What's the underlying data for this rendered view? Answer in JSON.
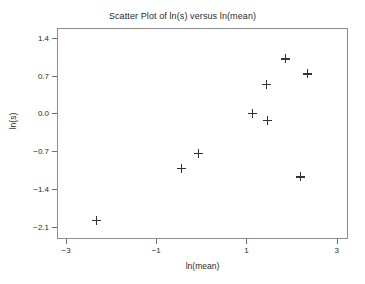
{
  "chart_data": {
    "type": "scatter",
    "title": "Scatter Plot of ln(s) versus ln(mean)",
    "xlabel": "ln(mean)",
    "ylabel": "ln(s)",
    "xlim": [
      -3.2,
      3.25
    ],
    "ylim": [
      -2.32,
      1.58
    ],
    "xticks": [
      -3,
      -1,
      1,
      3
    ],
    "xticklabels": [
      "−3",
      "−1",
      "1",
      "3"
    ],
    "yticks": [
      1.4,
      0.7,
      0.0,
      -0.7,
      -1.4,
      -2.1
    ],
    "yticklabels": [
      "1.4",
      "0.7",
      "0.0",
      "−0.7",
      "−1.4",
      "−2.1"
    ],
    "grid": false,
    "legend": false,
    "marker": "plus",
    "marker_color": "#333333",
    "frame_color": "#8c8c8c",
    "background": "#ffffff",
    "points": [
      {
        "x": -2.33,
        "y": -1.97
      },
      {
        "x": -0.45,
        "y": -1.02
      },
      {
        "x": -0.07,
        "y": -0.74
      },
      {
        "x": 1.13,
        "y": 0.0
      },
      {
        "x": 1.44,
        "y": 0.54
      },
      {
        "x": 1.46,
        "y": -0.13
      },
      {
        "x": 1.86,
        "y": 1.01
      },
      {
        "x": 2.2,
        "y": -1.17
      },
      {
        "x": 2.35,
        "y": 0.73
      }
    ]
  }
}
